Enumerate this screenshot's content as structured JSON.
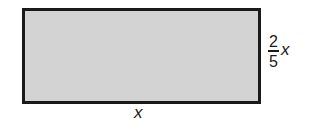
{
  "diagram": {
    "shape": "rectangle",
    "fill_color": "#d3d3d3",
    "stroke_color": "#1a1a1a",
    "width_label": "x",
    "height_label": {
      "numerator": "2",
      "denominator": "5",
      "variable": "x"
    }
  }
}
